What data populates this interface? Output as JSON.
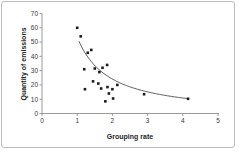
{
  "window": {
    "background_color": "#ffffff",
    "frame_border_color": "#bcbcbc"
  },
  "chart_data": {
    "type": "scatter",
    "title": "",
    "xlabel": "Grouping rate",
    "ylabel": "Quantity of emissions",
    "xlim": [
      0,
      5
    ],
    "ylim": [
      0,
      70
    ],
    "x_ticks": [
      0,
      1,
      2,
      3,
      4,
      5
    ],
    "y_ticks": [
      0,
      10,
      20,
      30,
      40,
      50,
      60,
      70
    ],
    "grid": false,
    "legend": false,
    "marker": {
      "shape": "square",
      "color": "#1c1c1c",
      "size": 2.6
    },
    "points": [
      [
        1.0,
        60
      ],
      [
        1.1,
        54
      ],
      [
        1.3,
        42.5
      ],
      [
        1.4,
        44.5
      ],
      [
        1.2,
        31
      ],
      [
        1.22,
        17
      ],
      [
        1.5,
        31.5
      ],
      [
        1.63,
        29
      ],
      [
        1.72,
        32
      ],
      [
        1.85,
        34
      ],
      [
        1.45,
        22.5
      ],
      [
        1.6,
        21
      ],
      [
        1.68,
        17.5
      ],
      [
        1.86,
        18.5
      ],
      [
        2.0,
        17
      ],
      [
        2.14,
        20
      ],
      [
        1.9,
        14
      ],
      [
        2.02,
        10.5
      ],
      [
        1.8,
        8.5
      ],
      [
        2.9,
        13.5
      ],
      [
        4.15,
        10.3
      ]
    ],
    "trendline": {
      "type": "power",
      "coefficient": 53.5,
      "exponent": -1.15,
      "x_start": 1.05,
      "x_end": 4.15,
      "color": "#4a4a4a"
    },
    "axis_color": "#9a9a9a",
    "tick_label_color": "#3a3a3a"
  }
}
